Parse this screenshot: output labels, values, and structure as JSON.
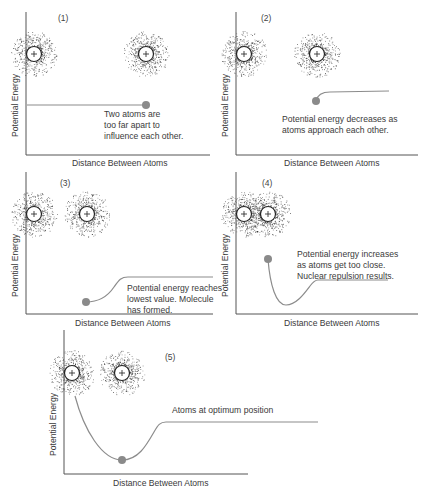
{
  "colors": {
    "axis": "#555555",
    "curve": "#8c8c8c",
    "dot": "#8a8a8a",
    "electron": "#2a2a2a",
    "nucleus_stroke": "#222222",
    "text": "#3a3a3a"
  },
  "common": {
    "y_axis_label": "Potential Energy",
    "x_axis_label": "Distance Between Atoms",
    "nucleus_symbol": "+"
  },
  "panels": [
    {
      "id": "(1)",
      "caption": "Two atoms are\ntoo far apart to\ninfluence each other.",
      "axis": {
        "x": 26,
        "top": 12,
        "bottom": 155,
        "right": 210
      },
      "number_pos": [
        58,
        14
      ],
      "caption_pos": [
        104,
        110
      ],
      "atoms": [
        [
          34,
          54
        ],
        [
          146,
          54
        ]
      ],
      "curve": "M27 105 L146 105",
      "dot": [
        146,
        105
      ],
      "ylabel_pos": [
        13,
        125
      ],
      "xlabel_pos": [
        118,
        164
      ]
    },
    {
      "id": "(2)",
      "caption": "Potential energy decreases as\natoms approach each other.",
      "axis": {
        "x": 236,
        "top": 12,
        "bottom": 155,
        "right": 418
      },
      "number_pos": [
        261,
        14
      ],
      "caption_pos": [
        282,
        115
      ],
      "atoms": [
        [
          244,
          54
        ],
        [
          317,
          54
        ]
      ],
      "curve": "M316 101 Q318 92 330 92 L389 91",
      "dot": [
        316,
        101
      ],
      "ylabel_pos": [
        223,
        125
      ],
      "xlabel_pos": [
        327,
        164
      ]
    },
    {
      "id": "(3)",
      "caption": "Potential energy reaches\nlowest value. Molecule\nhas formed.",
      "axis": {
        "x": 26,
        "top": 172,
        "bottom": 314,
        "right": 213
      },
      "number_pos": [
        60,
        178
      ],
      "caption_pos": [
        127,
        284
      ],
      "atoms": [
        [
          34,
          214
        ],
        [
          87,
          214
        ]
      ],
      "curve": "M86 302 C100 302 108 296 114 287 C119 280 121 277 128 277 L213 277",
      "dot": [
        86,
        302
      ],
      "ylabel_pos": [
        13,
        285
      ],
      "xlabel_pos": [
        118,
        323
      ]
    },
    {
      "id": "(4)",
      "caption": "Potential energy increases\nas atoms get too close.\nNuclear repulsion results.",
      "axis": {
        "x": 236,
        "top": 172,
        "bottom": 314,
        "right": 418
      },
      "number_pos": [
        262,
        179
      ],
      "caption_pos": [
        297,
        250
      ],
      "atoms": [
        [
          244,
          214
        ],
        [
          268,
          214
        ]
      ],
      "curve": "M268 259 C270 285 276 305 286 305 C296 305 304 294 310 286 C313 282 315 280 318 280 L388 280",
      "dot": [
        268,
        259
      ],
      "ylabel_pos": [
        223,
        285
      ],
      "xlabel_pos": [
        327,
        323
      ]
    },
    {
      "id": "(5)",
      "caption": "Atoms at optimum position",
      "axis": {
        "x": 64,
        "top": 330,
        "bottom": 474,
        "right": 248
      },
      "number_pos": [
        165,
        352
      ],
      "caption_pos": [
        172,
        406
      ],
      "atoms": [
        [
          72,
          373
        ],
        [
          122,
          373
        ]
      ],
      "curve": "M75 396 C84 430 102 460 122 460 C138 460 146 446 154 432 C158 425 160 422 166 422 L318 422",
      "dot": [
        122,
        460
      ],
      "ylabel_pos": [
        51,
        444
      ],
      "xlabel_pos": [
        155,
        483
      ]
    }
  ]
}
